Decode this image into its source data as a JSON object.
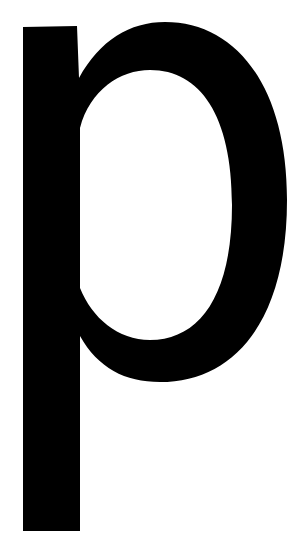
{
  "glyph": {
    "character": "p",
    "color": "#000000",
    "background": "#ffffff"
  }
}
